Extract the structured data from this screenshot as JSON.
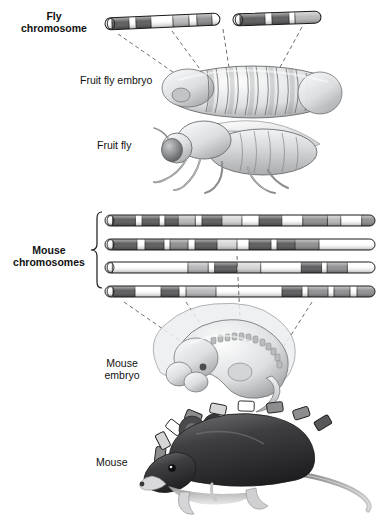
{
  "figure": {
    "background": "#ffffff"
  },
  "labels": {
    "fly_chromosome": {
      "line1": "Fly",
      "line2": "chromosome"
    },
    "fruit_fly_embryo": "Fruit fly embryo",
    "fruit_fly": "Fruit fly",
    "mouse_chromosomes": {
      "line1": "Mouse",
      "line2": "chromosomes"
    },
    "mouse_embryo": {
      "line1": "Mouse",
      "line2": "embryo"
    },
    "mouse": "Mouse"
  },
  "palette": {
    "band_dark": "#58585a",
    "band_mid": "#8d8d8f",
    "band_light": "#b8b8ba",
    "band_pale": "#d6d6d7",
    "band_white": "#ffffff",
    "outline": "#1a1a1a",
    "dash": "#6f6f70",
    "organism_fill": "#d9dadb",
    "organism_shade": "#a9abad",
    "mouse_body": "#3a3a3c"
  },
  "fly_chromosome": {
    "name": "fly-chromosome",
    "segments": [
      {
        "id": "fly-seg-a",
        "x": 105,
        "y": 18,
        "width": 115,
        "height": 12,
        "tilt": -2.5,
        "bands": [
          {
            "color": "#ffffff",
            "w": 7
          },
          {
            "color": "#58585a",
            "w": 17
          },
          {
            "color": "#ffffff",
            "w": 7
          },
          {
            "color": "#58585a",
            "w": 15
          },
          {
            "color": "#ffffff",
            "w": 22
          },
          {
            "color": "#b8b8ba",
            "w": 16
          },
          {
            "color": "#ffffff",
            "w": 8
          },
          {
            "color": "#8d8d8f",
            "w": 15
          },
          {
            "color": "#ffffff",
            "w": 8
          }
        ]
      },
      {
        "id": "fly-seg-b",
        "x": 233,
        "y": 14,
        "width": 88,
        "height": 12,
        "tilt": -2.0,
        "bands": [
          {
            "color": "#ffffff",
            "w": 7
          },
          {
            "color": "#58585a",
            "w": 25
          },
          {
            "color": "#ffffff",
            "w": 7
          },
          {
            "color": "#58585a",
            "w": 17
          },
          {
            "color": "#ffffff",
            "w": 6
          },
          {
            "color": "#b8b8ba",
            "w": 26
          }
        ]
      }
    ]
  },
  "mouse_chromosomes": {
    "name": "mouse-chromosomes",
    "count": 4,
    "rows": [
      {
        "id": "mouse-chr-1",
        "x": 105,
        "y": 215,
        "width": 270,
        "height": 11,
        "bands": [
          {
            "color": "#ffffff",
            "w": 8
          },
          {
            "color": "#58585a",
            "w": 24
          },
          {
            "color": "#ffffff",
            "w": 7
          },
          {
            "color": "#58585a",
            "w": 18
          },
          {
            "color": "#ffffff",
            "w": 6
          },
          {
            "color": "#58585a",
            "w": 14
          },
          {
            "color": "#b8b8ba",
            "w": 18
          },
          {
            "color": "#ffffff",
            "w": 7
          },
          {
            "color": "#58585a",
            "w": 21
          },
          {
            "color": "#d6d6d7",
            "w": 21
          },
          {
            "color": "#ffffff",
            "w": 18
          },
          {
            "color": "#58585a",
            "w": 24
          },
          {
            "color": "#ffffff",
            "w": 22
          },
          {
            "color": "#8d8d8f",
            "w": 26
          },
          {
            "color": "#b8b8ba",
            "w": 14
          },
          {
            "color": "#ffffff",
            "w": 22
          },
          {
            "color": "#8d8d8f",
            "w": 14
          }
        ]
      },
      {
        "id": "mouse-chr-2",
        "x": 105,
        "y": 239,
        "width": 270,
        "height": 11,
        "bands": [
          {
            "color": "#ffffff",
            "w": 8
          },
          {
            "color": "#58585a",
            "w": 24
          },
          {
            "color": "#ffffff",
            "w": 8
          },
          {
            "color": "#58585a",
            "w": 19
          },
          {
            "color": "#ffffff",
            "w": 6
          },
          {
            "color": "#8d8d8f",
            "w": 18
          },
          {
            "color": "#ffffff",
            "w": 7
          },
          {
            "color": "#58585a",
            "w": 22
          },
          {
            "color": "#d6d6d7",
            "w": 20
          },
          {
            "color": "#ffffff",
            "w": 12
          },
          {
            "color": "#58585a",
            "w": 22
          },
          {
            "color": "#ffffff",
            "w": 6
          },
          {
            "color": "#58585a",
            "w": 18
          },
          {
            "color": "#8d8d8f",
            "w": 24
          },
          {
            "color": "#ffffff",
            "w": 56
          }
        ]
      },
      {
        "id": "mouse-chr-3",
        "x": 105,
        "y": 262,
        "width": 270,
        "height": 11,
        "bands": [
          {
            "color": "#ffffff",
            "w": 8
          },
          {
            "color": "#ffffff",
            "w": 82
          },
          {
            "color": "#b8b8ba",
            "w": 22
          },
          {
            "color": "#ffffff",
            "w": 7
          },
          {
            "color": "#58585a",
            "w": 24
          },
          {
            "color": "#d6d6d7",
            "w": 26
          },
          {
            "color": "#ffffff",
            "w": 44
          },
          {
            "color": "#58585a",
            "w": 22
          },
          {
            "color": "#ffffff",
            "w": 6
          },
          {
            "color": "#8d8d8f",
            "w": 22
          },
          {
            "color": "#ffffff",
            "w": 30
          }
        ]
      },
      {
        "id": "mouse-chr-4",
        "x": 105,
        "y": 286,
        "width": 270,
        "height": 11,
        "bands": [
          {
            "color": "#ffffff",
            "w": 8
          },
          {
            "color": "#58585a",
            "w": 22
          },
          {
            "color": "#ffffff",
            "w": 26
          },
          {
            "color": "#58585a",
            "w": 18
          },
          {
            "color": "#ffffff",
            "w": 7
          },
          {
            "color": "#b8b8ba",
            "w": 30
          },
          {
            "color": "#ffffff",
            "w": 66
          },
          {
            "color": "#58585a",
            "w": 20
          },
          {
            "color": "#ffffff",
            "w": 6
          },
          {
            "color": "#8d8d8f",
            "w": 20
          },
          {
            "color": "#ffffff",
            "w": 6
          },
          {
            "color": "#8d8d8f",
            "w": 16
          },
          {
            "color": "#ffffff",
            "w": 7
          },
          {
            "color": "#8d8d8f",
            "w": 18
          }
        ]
      }
    ]
  },
  "mouse_back_bands": {
    "name": "mouse-back-band-row",
    "count": 9,
    "colors": [
      "#8d8d8f",
      "#d6d6d7",
      "#ffffff",
      "#8d8d8f",
      "#d6d6d7",
      "#ffffff",
      "#8d8d8f",
      "#8d8d8f",
      "#58585a"
    ]
  },
  "leader_lines": {
    "fly": [
      {
        "x1": 120,
        "y1": 33,
        "x2": 196,
        "y2": 86
      },
      {
        "x1": 172,
        "y1": 30,
        "x2": 206,
        "y2": 78
      },
      {
        "x1": 222,
        "y1": 28,
        "x2": 228,
        "y2": 72
      },
      {
        "x1": 300,
        "y1": 26,
        "x2": 272,
        "y2": 80
      }
    ],
    "mouse": [
      {
        "x1": 125,
        "y1": 300,
        "x2": 196,
        "y2": 350
      },
      {
        "x1": 185,
        "y1": 300,
        "x2": 213,
        "y2": 342
      },
      {
        "x1": 236,
        "y1": 300,
        "x2": 240,
        "y2": 336
      },
      {
        "x1": 310,
        "y1": 300,
        "x2": 283,
        "y2": 344
      }
    ]
  }
}
